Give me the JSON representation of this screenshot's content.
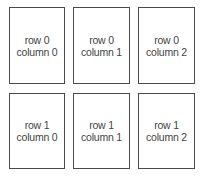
{
  "grid": {
    "rows": 2,
    "columns": 3,
    "cells": [
      {
        "row": 0,
        "col": 0,
        "line1": "row 0",
        "line2": "column 0"
      },
      {
        "row": 0,
        "col": 1,
        "line1": "row 0",
        "line2": "column 1"
      },
      {
        "row": 0,
        "col": 2,
        "line1": "row 0",
        "line2": "column 2"
      },
      {
        "row": 1,
        "col": 0,
        "line1": "row 1",
        "line2": "column 0"
      },
      {
        "row": 1,
        "col": 1,
        "line1": "row 1",
        "line2": "column 1"
      },
      {
        "row": 1,
        "col": 2,
        "line1": "row 1",
        "line2": "column 2"
      }
    ]
  },
  "colors": {
    "border": "#4a4a4a",
    "text": "#444444",
    "background": "#ffffff"
  }
}
